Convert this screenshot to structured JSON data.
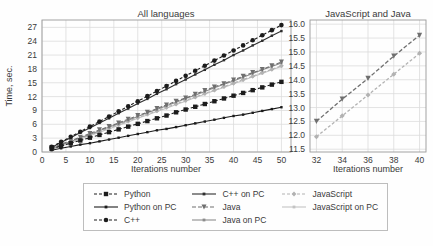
{
  "chart_data": [
    {
      "id": "all-languages",
      "type": "line",
      "title": "All languages",
      "xlabel": "Iterations number",
      "ylabel": "Time, sec.",
      "xlim": [
        0,
        52
      ],
      "ylim": [
        0,
        28.6
      ],
      "grid": true,
      "xtick_labels": [
        "0",
        "5",
        "10",
        "15",
        "20",
        "25",
        "30",
        "35",
        "40",
        "45",
        "50"
      ],
      "ytick_labels": [
        "0",
        "3",
        "6",
        "9",
        "12",
        "15",
        "18",
        "21",
        "24",
        "27"
      ],
      "x": [
        2,
        4,
        6,
        8,
        10,
        12,
        14,
        16,
        18,
        20,
        22,
        24,
        26,
        28,
        30,
        32,
        34,
        36,
        38,
        40,
        42,
        44,
        46,
        48,
        50
      ],
      "series": [
        {
          "name": "JavaScript on PC",
          "color": "#c3c3c3",
          "dash": "",
          "marker": "square",
          "marker_size": 1.1,
          "line_width": 1.1,
          "values": [
            0.5,
            1.3,
            2.0,
            2.8,
            3.5,
            4.3,
            5.0,
            5.8,
            6.5,
            7.3,
            8.0,
            8.8,
            9.5,
            10.3,
            11.0,
            11.8,
            12.5,
            13.3,
            14.0,
            14.8,
            15.5,
            16.3,
            17.0,
            17.8,
            18.5
          ]
        },
        {
          "name": "JavaScript",
          "color": "#b2b2b2",
          "dash": "3 2",
          "marker": "diamond",
          "marker_size": 2.4,
          "line_width": 1.1,
          "values": [
            0.7,
            1.4,
            2.2,
            2.9,
            3.7,
            4.4,
            5.2,
            5.9,
            6.7,
            7.4,
            8.2,
            8.9,
            9.7,
            10.4,
            11.2,
            11.9,
            12.7,
            13.4,
            14.2,
            14.9,
            15.7,
            16.4,
            17.2,
            17.9,
            18.7
          ]
        },
        {
          "name": "Java on PC",
          "color": "#8c8c8c",
          "dash": "",
          "marker": "square",
          "marker_size": 1.1,
          "line_width": 1.1,
          "values": [
            0.7,
            1.5,
            2.3,
            3.1,
            3.8,
            4.6,
            5.4,
            6.1,
            6.9,
            7.7,
            8.5,
            9.2,
            10.0,
            10.8,
            11.6,
            12.3,
            13.1,
            13.9,
            14.7,
            15.4,
            16.2,
            17.0,
            17.8,
            18.5,
            19.3
          ]
        },
        {
          "name": "Java",
          "color": "#6f6f6f",
          "dash": "4 2",
          "marker": "triangle-down",
          "marker_size": 2.5,
          "line_width": 1.1,
          "values": [
            0.9,
            1.7,
            2.4,
            3.2,
            4.0,
            4.8,
            5.5,
            6.3,
            7.1,
            7.9,
            8.6,
            9.4,
            10.2,
            11.0,
            11.7,
            12.5,
            13.3,
            14.1,
            14.8,
            15.6,
            16.4,
            17.2,
            17.9,
            18.7,
            19.5
          ]
        },
        {
          "name": "C++ on PC",
          "color": "#2e2e2e",
          "dash": "",
          "marker": "square",
          "marker_size": 1.2,
          "line_width": 1.1,
          "values": [
            1.0,
            2.1,
            3.1,
            4.2,
            5.2,
            6.3,
            7.3,
            8.4,
            9.4,
            10.5,
            11.5,
            12.6,
            13.6,
            14.7,
            15.7,
            16.8,
            17.8,
            18.9,
            19.9,
            21.0,
            22.0,
            23.1,
            24.1,
            25.2,
            26.2
          ]
        },
        {
          "name": "C++",
          "color": "#1c1c1c",
          "dash": "3 2",
          "marker": "circle",
          "marker_size": 2.3,
          "line_width": 1.1,
          "values": [
            1.1,
            2.2,
            3.3,
            4.4,
            5.5,
            6.6,
            7.7,
            8.8,
            9.9,
            11.0,
            12.1,
            13.2,
            14.3,
            15.4,
            16.5,
            17.6,
            18.7,
            19.8,
            20.9,
            22.0,
            23.1,
            24.2,
            25.3,
            26.4,
            27.5
          ]
        },
        {
          "name": "Python on PC",
          "color": "#1c1c1c",
          "dash": "",
          "marker": "square",
          "marker_size": 1.2,
          "line_width": 1.1,
          "values": [
            0.4,
            0.8,
            1.2,
            1.6,
            1.9,
            2.3,
            2.7,
            3.1,
            3.5,
            3.9,
            4.3,
            4.7,
            5.0,
            5.4,
            5.8,
            6.2,
            6.6,
            7.0,
            7.4,
            7.8,
            8.1,
            8.5,
            8.9,
            9.3,
            9.7
          ]
        },
        {
          "name": "Python",
          "color": "#1c1c1c",
          "dash": "3 2",
          "marker": "square",
          "marker_size": 2.2,
          "line_width": 1.1,
          "values": [
            0.7,
            1.3,
            1.9,
            2.5,
            3.1,
            3.7,
            4.3,
            4.9,
            5.5,
            6.1,
            6.7,
            7.3,
            7.9,
            8.6,
            9.2,
            9.8,
            10.4,
            11.0,
            11.6,
            12.2,
            12.8,
            13.4,
            14.0,
            14.6,
            15.2
          ]
        }
      ]
    },
    {
      "id": "javascript-and-java",
      "type": "line",
      "title": "JavaScript and Java",
      "xlabel": "Iterations number",
      "ylabel": "",
      "xlim": [
        31.5,
        40.5
      ],
      "ylim": [
        11.4,
        16.15
      ],
      "grid": true,
      "xtick_labels": [
        "32",
        "34",
        "36",
        "38",
        "40"
      ],
      "ytick_labels": [
        "11.5",
        "12.0",
        "12.5",
        "13.0",
        "13.5",
        "14.0",
        "14.5",
        "15.0",
        "15.5",
        "16.0"
      ],
      "x": [
        32,
        34,
        36,
        38,
        40
      ],
      "series": [
        {
          "name": "JavaScript",
          "color": "#b2b2b2",
          "dash": "3 2",
          "marker": "diamond",
          "marker_size": 2.5,
          "line_width": 1.3,
          "values": [
            11.95,
            12.7,
            13.45,
            14.2,
            14.95
          ]
        },
        {
          "name": "Java",
          "color": "#6f6f6f",
          "dash": "4 2",
          "marker": "triangle-down",
          "marker_size": 2.6,
          "line_width": 1.3,
          "values": [
            12.5,
            13.3,
            14.05,
            14.85,
            15.6
          ]
        }
      ]
    }
  ],
  "legend": {
    "items": [
      "Python",
      "Python on PC",
      "C++",
      "C++ on PC",
      "Java",
      "Java on PC",
      "JavaScript",
      "JavaScript on PC"
    ],
    "columns": [
      [
        0,
        1,
        2
      ],
      [
        3,
        4,
        5
      ],
      [
        6,
        7
      ]
    ]
  },
  "colors": {
    "grid": "#dcdcdc",
    "axis_border": "#9a9a9a",
    "text": "#3a3a3a",
    "background": "#fefefe"
  }
}
